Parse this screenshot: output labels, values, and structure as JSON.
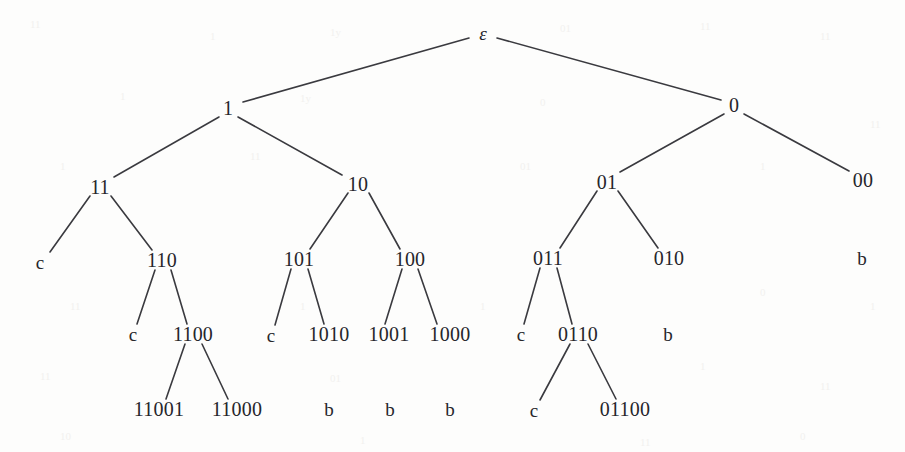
{
  "figure": {
    "kind": "binary-trie-diagram",
    "title": "",
    "width": 905,
    "height": 452,
    "background_color": "#fdfdfc",
    "text_color": "#26262b",
    "edge_color": "#3a3a3f",
    "edge_width": 1.6,
    "root_label": "ε",
    "leaf_labels": [
      "c",
      "b"
    ]
  },
  "chart_data": {
    "type": "diagram",
    "subtype": "binary-trie",
    "title": "",
    "root": "ε",
    "nodes": [
      {
        "id": "eps",
        "label": "ε",
        "x": 483,
        "y": 33,
        "level": 0,
        "kind": "internal"
      },
      {
        "id": "1",
        "label": "1",
        "x": 228,
        "y": 108,
        "level": 1,
        "kind": "internal"
      },
      {
        "id": "0",
        "label": "0",
        "x": 734,
        "y": 105,
        "level": 1,
        "kind": "internal"
      },
      {
        "id": "11",
        "label": "11",
        "x": 100,
        "y": 187,
        "level": 2,
        "kind": "internal"
      },
      {
        "id": "10",
        "label": "10",
        "x": 358,
        "y": 184,
        "level": 2,
        "kind": "internal"
      },
      {
        "id": "01",
        "label": "01",
        "x": 607,
        "y": 182,
        "level": 2,
        "kind": "internal"
      },
      {
        "id": "00",
        "label": "00",
        "x": 863,
        "y": 180,
        "level": 2,
        "kind": "internal"
      },
      {
        "id": "11c",
        "label": "c",
        "x": 40,
        "y": 262,
        "level": 3,
        "kind": "leaf"
      },
      {
        "id": "110",
        "label": "110",
        "x": 162,
        "y": 260,
        "level": 3,
        "kind": "internal"
      },
      {
        "id": "101",
        "label": "101",
        "x": 299,
        "y": 259,
        "level": 3,
        "kind": "internal"
      },
      {
        "id": "100",
        "label": "100",
        "x": 410,
        "y": 259,
        "level": 3,
        "kind": "internal"
      },
      {
        "id": "011",
        "label": "011",
        "x": 548,
        "y": 258,
        "level": 3,
        "kind": "internal"
      },
      {
        "id": "010",
        "label": "010",
        "x": 669,
        "y": 258,
        "level": 3,
        "kind": "internal"
      },
      {
        "id": "00b",
        "label": "b",
        "x": 862,
        "y": 258,
        "level": 3,
        "kind": "leaf"
      },
      {
        "id": "110c",
        "label": "c",
        "x": 133,
        "y": 334,
        "level": 4,
        "kind": "leaf"
      },
      {
        "id": "1100",
        "label": "1100",
        "x": 193,
        "y": 334,
        "level": 4,
        "kind": "internal"
      },
      {
        "id": "101c",
        "label": "c",
        "x": 271,
        "y": 335,
        "level": 4,
        "kind": "leaf"
      },
      {
        "id": "1010",
        "label": "1010",
        "x": 329,
        "y": 334,
        "level": 4,
        "kind": "internal"
      },
      {
        "id": "1001",
        "label": "1001",
        "x": 389,
        "y": 334,
        "level": 4,
        "kind": "internal"
      },
      {
        "id": "1000",
        "label": "1000",
        "x": 450,
        "y": 334,
        "level": 4,
        "kind": "internal"
      },
      {
        "id": "011c",
        "label": "c",
        "x": 521,
        "y": 334,
        "level": 4,
        "kind": "leaf"
      },
      {
        "id": "0110",
        "label": "0110",
        "x": 578,
        "y": 334,
        "level": 4,
        "kind": "internal"
      },
      {
        "id": "010b",
        "label": "b",
        "x": 668,
        "y": 334,
        "level": 4,
        "kind": "leaf"
      },
      {
        "id": "11001",
        "label": "11001",
        "x": 159,
        "y": 409,
        "level": 5,
        "kind": "internal"
      },
      {
        "id": "11000",
        "label": "11000",
        "x": 237,
        "y": 409,
        "level": 5,
        "kind": "internal"
      },
      {
        "id": "1010b",
        "label": "b",
        "x": 329,
        "y": 409,
        "level": 5,
        "kind": "leaf"
      },
      {
        "id": "1001b",
        "label": "b",
        "x": 390,
        "y": 409,
        "level": 5,
        "kind": "leaf"
      },
      {
        "id": "1000b",
        "label": "b",
        "x": 450,
        "y": 409,
        "level": 5,
        "kind": "leaf"
      },
      {
        "id": "0110c",
        "label": "c",
        "x": 534,
        "y": 410,
        "level": 5,
        "kind": "leaf"
      },
      {
        "id": "01100",
        "label": "01100",
        "x": 625,
        "y": 409,
        "level": 5,
        "kind": "internal"
      }
    ],
    "edges": [
      {
        "from": "eps",
        "to": "1",
        "x1": 469,
        "y1": 38,
        "x2": 243,
        "y2": 102
      },
      {
        "from": "eps",
        "to": "0",
        "x1": 497,
        "y1": 38,
        "x2": 721,
        "y2": 100
      },
      {
        "from": "1",
        "to": "11",
        "x1": 219,
        "y1": 117,
        "x2": 114,
        "y2": 177
      },
      {
        "from": "1",
        "to": "10",
        "x1": 238,
        "y1": 117,
        "x2": 342,
        "y2": 175
      },
      {
        "from": "0",
        "to": "01",
        "x1": 724,
        "y1": 114,
        "x2": 620,
        "y2": 172
      },
      {
        "from": "0",
        "to": "00",
        "x1": 744,
        "y1": 114,
        "x2": 849,
        "y2": 171
      },
      {
        "from": "11",
        "to": "11c",
        "x1": 90,
        "y1": 196,
        "x2": 50,
        "y2": 252
      },
      {
        "from": "11",
        "to": "110",
        "x1": 111,
        "y1": 196,
        "x2": 152,
        "y2": 250
      },
      {
        "from": "10",
        "to": "101",
        "x1": 348,
        "y1": 193,
        "x2": 310,
        "y2": 249
      },
      {
        "from": "10",
        "to": "100",
        "x1": 369,
        "y1": 193,
        "x2": 400,
        "y2": 249
      },
      {
        "from": "01",
        "to": "011",
        "x1": 597,
        "y1": 191,
        "x2": 560,
        "y2": 248
      },
      {
        "from": "01",
        "to": "010",
        "x1": 618,
        "y1": 191,
        "x2": 658,
        "y2": 248
      },
      {
        "from": "110",
        "to": "110c",
        "x1": 155,
        "y1": 270,
        "x2": 137,
        "y2": 324
      },
      {
        "from": "110",
        "to": "1100",
        "x1": 171,
        "y1": 270,
        "x2": 187,
        "y2": 324
      },
      {
        "from": "101",
        "to": "101c",
        "x1": 291,
        "y1": 269,
        "x2": 275,
        "y2": 325
      },
      {
        "from": "101",
        "to": "1010",
        "x1": 308,
        "y1": 269,
        "x2": 324,
        "y2": 324
      },
      {
        "from": "100",
        "to": "1001",
        "x1": 402,
        "y1": 269,
        "x2": 385,
        "y2": 324
      },
      {
        "from": "100",
        "to": "1000",
        "x1": 418,
        "y1": 269,
        "x2": 437,
        "y2": 324
      },
      {
        "from": "011",
        "to": "011c",
        "x1": 540,
        "y1": 268,
        "x2": 524,
        "y2": 324
      },
      {
        "from": "011",
        "to": "0110",
        "x1": 557,
        "y1": 268,
        "x2": 572,
        "y2": 324
      },
      {
        "from": "1100",
        "to": "11001",
        "x1": 185,
        "y1": 344,
        "x2": 166,
        "y2": 399
      },
      {
        "from": "1100",
        "to": "11000",
        "x1": 202,
        "y1": 344,
        "x2": 228,
        "y2": 399
      },
      {
        "from": "0110",
        "to": "0110c",
        "x1": 570,
        "y1": 344,
        "x2": 540,
        "y2": 400
      },
      {
        "from": "0110",
        "to": "01100",
        "x1": 588,
        "y1": 344,
        "x2": 616,
        "y2": 399
      }
    ],
    "notes": [
      "Leaf markers 'c' and 'b' terminate branches.",
      "Node 010 shows a 'b' marker below it without a drawn edge.",
      "Node 00 shows a 'b' marker below it without a drawn edge.",
      "Nodes 1010, 1001, 1000 show 'b' markers below them without drawn edges."
    ]
  },
  "artifacts": {
    "description": "faint show-through marks from the reverse side of the scanned page",
    "marks": [
      {
        "text": "11",
        "x": 30,
        "y": 18
      },
      {
        "text": "1",
        "x": 210,
        "y": 30
      },
      {
        "text": "1y",
        "x": 330,
        "y": 26
      },
      {
        "text": "01",
        "x": 560,
        "y": 22
      },
      {
        "text": "11",
        "x": 700,
        "y": 20
      },
      {
        "text": "11",
        "x": 820,
        "y": 30
      },
      {
        "text": "1",
        "x": 120,
        "y": 90
      },
      {
        "text": "1y",
        "x": 300,
        "y": 92
      },
      {
        "text": "0",
        "x": 540,
        "y": 96
      },
      {
        "text": "11",
        "x": 870,
        "y": 118
      },
      {
        "text": "1",
        "x": 60,
        "y": 160
      },
      {
        "text": "11",
        "x": 250,
        "y": 150
      },
      {
        "text": "01",
        "x": 520,
        "y": 160
      },
      {
        "text": "1",
        "x": 760,
        "y": 160
      },
      {
        "text": "11",
        "x": 70,
        "y": 300
      },
      {
        "text": "1",
        "x": 300,
        "y": 300
      },
      {
        "text": "1",
        "x": 480,
        "y": 300
      },
      {
        "text": "0",
        "x": 760,
        "y": 286
      },
      {
        "text": "1",
        "x": 870,
        "y": 300
      },
      {
        "text": "11",
        "x": 40,
        "y": 370
      },
      {
        "text": "01",
        "x": 330,
        "y": 372
      },
      {
        "text": "1",
        "x": 700,
        "y": 360
      },
      {
        "text": "11",
        "x": 820,
        "y": 380
      },
      {
        "text": "10",
        "x": 60,
        "y": 430
      },
      {
        "text": "1",
        "x": 360,
        "y": 434
      },
      {
        "text": "11",
        "x": 640,
        "y": 436
      },
      {
        "text": "0",
        "x": 800,
        "y": 430
      }
    ]
  }
}
